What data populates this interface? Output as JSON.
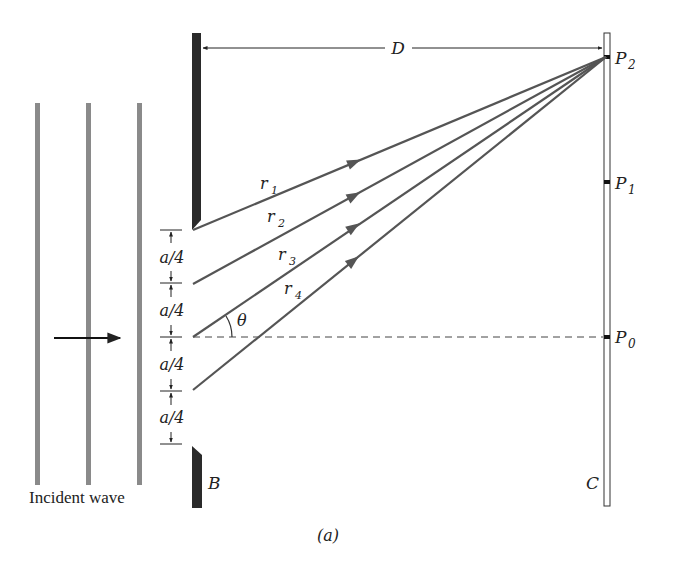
{
  "figure": {
    "caption": "(a)",
    "incident_wave_label": "Incident wave",
    "barrier_label": "B",
    "screen_label": "C",
    "distance_label": "D",
    "angle_label": "θ",
    "points": [
      {
        "name": "P",
        "sub": "2"
      },
      {
        "name": "P",
        "sub": "1"
      },
      {
        "name": "P",
        "sub": "0"
      }
    ],
    "rays": [
      {
        "name": "r",
        "sub": "1"
      },
      {
        "name": "r",
        "sub": "2"
      },
      {
        "name": "r",
        "sub": "3"
      },
      {
        "name": "r",
        "sub": "4"
      }
    ],
    "segment_labels": [
      "a/4",
      "a/4",
      "a/4",
      "a/4"
    ],
    "colors": {
      "ray": "#555555",
      "wave": "#8a8a8a",
      "barrier": "#2a2a2a",
      "text": "#222222"
    }
  }
}
